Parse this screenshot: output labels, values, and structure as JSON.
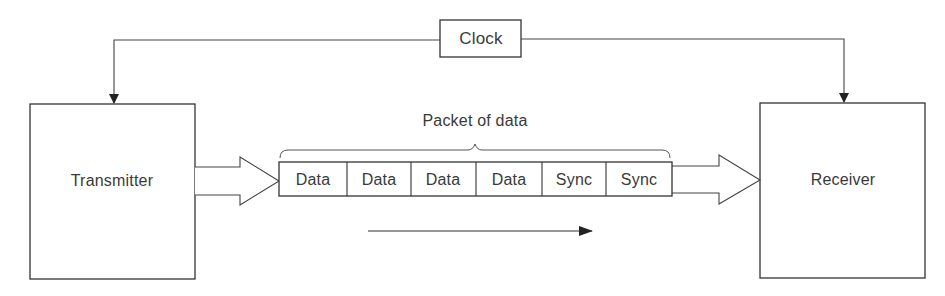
{
  "diagram": {
    "clock": {
      "label": "Clock"
    },
    "transmitter": {
      "label": "Transmitter"
    },
    "receiver": {
      "label": "Receiver"
    },
    "packet": {
      "label": "Packet of data",
      "cells": [
        {
          "label": "Data"
        },
        {
          "label": "Data"
        },
        {
          "label": "Data"
        },
        {
          "label": "Data"
        },
        {
          "label": "Sync"
        },
        {
          "label": "Sync"
        }
      ]
    },
    "direction_arrow": {
      "direction": "right"
    },
    "stroke_color": "#333333"
  }
}
